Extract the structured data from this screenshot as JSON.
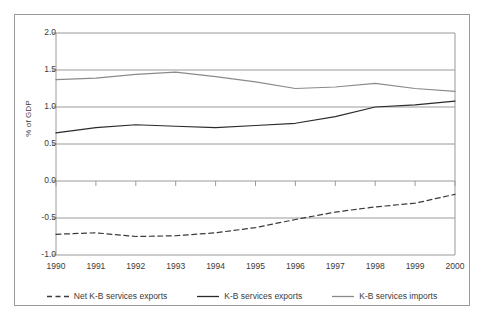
{
  "chart_data": {
    "type": "line",
    "title": "",
    "xlabel": "",
    "ylabel": "% of GDP",
    "x": [
      1990,
      1991,
      1992,
      1993,
      1994,
      1995,
      1996,
      1997,
      1998,
      1999,
      2000
    ],
    "categories": [
      "1990",
      "1991",
      "1992",
      "1993",
      "1994",
      "1995",
      "1996",
      "1997",
      "1998",
      "1999",
      "2000"
    ],
    "ylim": [
      -1.0,
      2.0
    ],
    "yticks": [
      2.0,
      1.5,
      1.0,
      0.5,
      0.0,
      -0.5,
      -1.0
    ],
    "ytick_labels": [
      "2.0",
      "1.5",
      "1.0",
      "0.5",
      "0.0",
      "-0.5",
      "-1.0"
    ],
    "grid": true,
    "grid_axis": "y",
    "legend_position": "bottom",
    "series": [
      {
        "name": "Net K-B services exports",
        "style": "dashed",
        "color": "#3b3b3b",
        "values": [
          -0.72,
          -0.7,
          -0.75,
          -0.74,
          -0.7,
          -0.63,
          -0.52,
          -0.42,
          -0.35,
          -0.3,
          -0.18
        ]
      },
      {
        "name": "K-B services exports",
        "style": "solid",
        "color": "#2b2b2b",
        "values": [
          0.65,
          0.72,
          0.76,
          0.74,
          0.72,
          0.75,
          0.78,
          0.87,
          1.0,
          1.03,
          1.08
        ]
      },
      {
        "name": "K-B services imports",
        "style": "solid",
        "color": "#8a8a8a",
        "values": [
          1.37,
          1.39,
          1.44,
          1.47,
          1.41,
          1.34,
          1.25,
          1.27,
          1.32,
          1.25,
          1.21
        ]
      }
    ]
  },
  "figure": {
    "frame_color": "#9a9a9a",
    "grid_color": "#9a9a9a",
    "background": "#ffffff"
  }
}
